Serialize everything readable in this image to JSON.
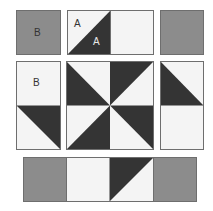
{
  "diagram": {
    "colors": {
      "gray": "#8c8c8c",
      "dark": "#343434",
      "light": "#f4f4f4",
      "border": "#6e6e6e",
      "label_on_light": "#333333",
      "label_on_dark": "#e8e8e8"
    },
    "labels": {
      "top_left_square": "B",
      "hst_light_half": "A",
      "hst_dark_half": "A",
      "left_rect_top": "B"
    },
    "rows": [
      {
        "name": "top-row",
        "pieces": [
          "gray-square B",
          "HST (A/A) + light square",
          "gray-square"
        ]
      },
      {
        "name": "middle-row",
        "pieces": [
          "light square B + HST",
          "pinwheel center (4 HST)",
          "HST + light square"
        ]
      },
      {
        "name": "bottom-row",
        "pieces": [
          "gray-square",
          "light square",
          "HST",
          "gray-square"
        ]
      }
    ]
  }
}
